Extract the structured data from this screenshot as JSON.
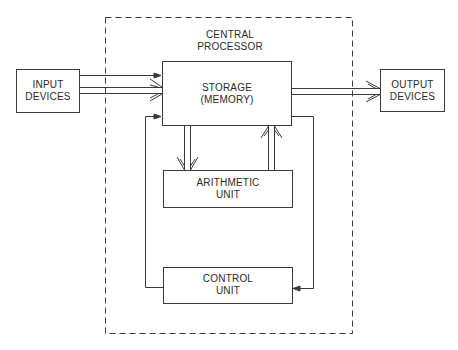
{
  "diagram": {
    "type": "block-diagram",
    "container": {
      "label_line1": "CENTRAL",
      "label_line2": "PROCESSOR",
      "style": "dashed"
    },
    "blocks": {
      "input": {
        "line1": "INPUT",
        "line2": "DEVICES"
      },
      "storage": {
        "line1": "STORAGE",
        "line2": "(MEMORY)"
      },
      "output": {
        "line1": "OUTPUT",
        "line2": "DEVICES"
      },
      "arithmetic": {
        "line1": "ARITHMETIC",
        "line2": "UNIT"
      },
      "control": {
        "line1": "CONTROL",
        "line2": "UNIT"
      }
    },
    "edges": [
      {
        "from": "input",
        "to": "storage",
        "kind": "control-line"
      },
      {
        "from": "input",
        "to": "storage",
        "kind": "data-double"
      },
      {
        "from": "storage",
        "to": "output",
        "kind": "data-double"
      },
      {
        "from": "storage",
        "to": "arithmetic",
        "kind": "data-double"
      },
      {
        "from": "arithmetic",
        "to": "storage",
        "kind": "data-double"
      },
      {
        "from": "control",
        "to": "storage",
        "kind": "control-line"
      },
      {
        "from": "storage",
        "to": "control",
        "kind": "control-line"
      }
    ],
    "colors": {
      "line": "#3a3a3a",
      "background": "#ffffff"
    }
  }
}
